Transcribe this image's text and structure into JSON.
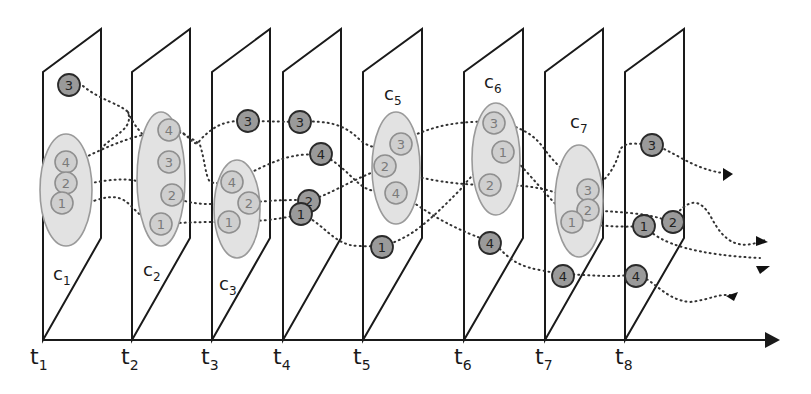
{
  "diagram": {
    "axis": {
      "arrow": true
    },
    "time_labels": [
      {
        "base": "t",
        "sub": "1",
        "x": 30
      },
      {
        "base": "t",
        "sub": "2",
        "x": 121
      },
      {
        "base": "t",
        "sub": "3",
        "x": 201
      },
      {
        "base": "t",
        "sub": "4",
        "x": 273
      },
      {
        "base": "t",
        "sub": "5",
        "x": 353
      },
      {
        "base": "t",
        "sub": "6",
        "x": 454
      },
      {
        "base": "t",
        "sub": "7",
        "x": 535
      },
      {
        "base": "t",
        "sub": "8",
        "x": 615
      }
    ],
    "cluster_labels": [
      {
        "base": "c",
        "sub": "1"
      },
      {
        "base": "c",
        "sub": "2"
      },
      {
        "base": "c",
        "sub": "3"
      },
      {
        "base": "c",
        "sub": "5"
      },
      {
        "base": "c",
        "sub": "6"
      },
      {
        "base": "c",
        "sub": "7"
      }
    ],
    "node_labels": [
      "1",
      "2",
      "3",
      "4"
    ],
    "colors": {
      "plane_stroke": "#1a1a1a",
      "cluster_fill": "#e2e2e2",
      "cluster_stroke": "#9a9a9a",
      "node_in_cluster_fill": "#cfcfcf",
      "node_outlier_fill": "#9a9a9a"
    }
  }
}
